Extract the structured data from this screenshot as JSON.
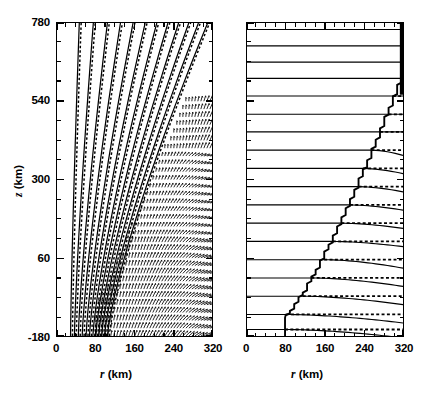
{
  "figure": {
    "kind": "two-panel scientific contour figure",
    "background": "#ffffff",
    "line_color": "#000000",
    "width_px": 428,
    "height_px": 394
  },
  "axes": {
    "x": {
      "label_prefix": "r",
      "label_unit": " (km)",
      "min": 0,
      "max": 320,
      "major_ticks": [
        0,
        80,
        160,
        240,
        320
      ],
      "major_tick_labels": [
        "0",
        "80",
        "160",
        "240",
        "320"
      ],
      "minor_tick_interval": 20
    },
    "y": {
      "label_prefix": "z",
      "label_unit": " (km)",
      "min": -180,
      "max": 780,
      "major_ticks": [
        -180,
        60,
        300,
        540,
        780
      ],
      "major_tick_labels": [
        "-180",
        "60",
        "300",
        "540",
        "780"
      ],
      "minor_tick_interval": 60
    }
  },
  "panels": [
    {
      "id": "left",
      "name": "left-panel",
      "description": "Curved contour family with overlaid dense vector field",
      "has_vector_field": true,
      "contour_style": "paired solid and dashed curves fanning right with height"
    },
    {
      "id": "right",
      "name": "right-panel",
      "description": "Near-horizontal contour family with staircase boundary",
      "has_vector_field": false,
      "contour_style": "paired solid and dashed horizontal curves with stepped left terminus"
    }
  ],
  "chart_data": {
    "type": "line",
    "title": "",
    "xlabel": "r (km)",
    "ylabel": "z (km)",
    "xlim": [
      0,
      320
    ],
    "ylim": [
      -180,
      780
    ],
    "grid": false,
    "legend": "none",
    "panels": [
      {
        "name": "left-panel",
        "series": [
          {
            "name": "contour-1",
            "style": "solid-dashed-pair",
            "x_at_bottom": 28,
            "x_at_top": 46
          },
          {
            "name": "contour-2",
            "style": "solid-dashed-pair",
            "x_at_bottom": 36,
            "x_at_top": 75
          },
          {
            "name": "contour-3",
            "style": "solid-dashed-pair",
            "x_at_bottom": 44,
            "x_at_top": 104
          },
          {
            "name": "contour-4",
            "style": "solid-dashed-pair",
            "x_at_bottom": 52,
            "x_at_top": 131
          },
          {
            "name": "contour-5",
            "style": "solid-dashed-pair",
            "x_at_bottom": 60,
            "x_at_top": 157
          },
          {
            "name": "contour-6",
            "style": "solid-dashed-pair",
            "x_at_bottom": 67,
            "x_at_top": 182
          },
          {
            "name": "contour-7",
            "style": "solid-dashed-pair",
            "x_at_bottom": 74,
            "x_at_top": 206
          },
          {
            "name": "contour-8",
            "style": "solid-dashed-pair",
            "x_at_bottom": 80,
            "x_at_top": 229
          },
          {
            "name": "contour-9",
            "style": "solid-dashed-pair",
            "x_at_bottom": 86,
            "x_at_top": 251
          },
          {
            "name": "contour-10",
            "style": "solid-dashed-pair",
            "x_at_bottom": 92,
            "x_at_top": 272
          },
          {
            "name": "contour-11",
            "style": "solid-dashed-pair",
            "x_at_bottom": 98,
            "x_at_top": 292
          },
          {
            "name": "contour-12",
            "style": "solid-dashed-pair",
            "x_at_bottom": 104,
            "x_at_top": 311
          }
        ],
        "vector_field": {
          "present": true,
          "region_x": [
            80,
            320
          ],
          "region_y": [
            -180,
            560
          ],
          "description": "dense arrow grid, arrows rotate from vertical near axis to radial outflow at right"
        }
      },
      {
        "name": "right-panel",
        "series": [
          {
            "name": "level-1",
            "z": 760,
            "x_start": 0,
            "x_end": 320
          },
          {
            "name": "level-2",
            "z": 710,
            "x_start": 0,
            "x_end": 320
          },
          {
            "name": "level-3",
            "z": 660,
            "x_start": 0,
            "x_end": 320
          },
          {
            "name": "level-4",
            "z": 610,
            "x_start": 0,
            "x_end": 320
          },
          {
            "name": "level-5",
            "z": 556,
            "x_start": 0,
            "x_end": 320
          },
          {
            "name": "level-6",
            "z": 500,
            "x_start": 0,
            "x_end": 320
          },
          {
            "name": "level-7",
            "z": 446,
            "x_start": 0,
            "x_end": 320
          },
          {
            "name": "level-8",
            "z": 390,
            "x_start": 0,
            "x_end": 320
          },
          {
            "name": "level-9",
            "z": 334,
            "x_start": 0,
            "x_end": 320
          },
          {
            "name": "level-10",
            "z": 278,
            "x_start": 0,
            "x_end": 320
          },
          {
            "name": "level-11",
            "z": 222,
            "x_start": 0,
            "x_end": 320
          },
          {
            "name": "level-12",
            "z": 166,
            "x_start": 0,
            "x_end": 320
          },
          {
            "name": "level-13",
            "z": 110,
            "x_start": 0,
            "x_end": 320
          },
          {
            "name": "level-14",
            "z": 54,
            "x_start": 0,
            "x_end": 320
          },
          {
            "name": "level-15",
            "z": -2,
            "x_start": 0,
            "x_end": 320
          },
          {
            "name": "level-16",
            "z": -58,
            "x_start": 0,
            "x_end": 320
          },
          {
            "name": "level-17",
            "z": -114,
            "x_start": 0,
            "x_end": 320
          },
          {
            "name": "level-18",
            "z": -160,
            "x_start": 0,
            "x_end": 320
          }
        ],
        "boundary": {
          "name": "staircase-boundary",
          "description": "stepped front rising from r~78 km at z=-180 to r~320 km at z~620 km"
        }
      }
    ]
  }
}
